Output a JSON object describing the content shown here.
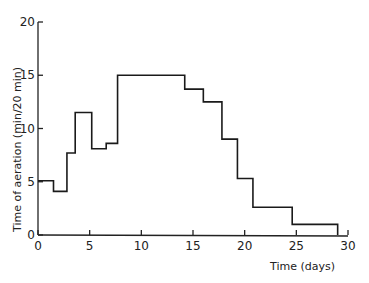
{
  "chart_data": {
    "type": "line",
    "style": "step",
    "title": "",
    "xlabel": "Time (days)",
    "ylabel": "Time of aeration (min/20 min)",
    "xlim": [
      0,
      30
    ],
    "ylim": [
      0,
      20
    ],
    "x_ticks": [
      0,
      5,
      10,
      15,
      20,
      25,
      30
    ],
    "y_ticks": [
      0,
      5,
      10,
      15,
      20
    ],
    "x_tick_labels": [
      "0",
      "5",
      "10",
      "15",
      "20",
      "25",
      "30"
    ],
    "y_tick_labels": [
      "0",
      "5",
      "10",
      "15",
      "20"
    ],
    "grid": false,
    "legend": null,
    "series": [
      {
        "name": "Time of aeration",
        "steps": [
          {
            "x_start": 0.0,
            "x_end": 1.5,
            "y": 5.1
          },
          {
            "x_start": 1.5,
            "x_end": 2.8,
            "y": 4.1
          },
          {
            "x_start": 2.8,
            "x_end": 3.6,
            "y": 7.7
          },
          {
            "x_start": 3.6,
            "x_end": 5.2,
            "y": 11.5
          },
          {
            "x_start": 5.2,
            "x_end": 6.6,
            "y": 8.1
          },
          {
            "x_start": 6.6,
            "x_end": 7.7,
            "y": 8.6
          },
          {
            "x_start": 7.7,
            "x_end": 14.2,
            "y": 15.0
          },
          {
            "x_start": 14.2,
            "x_end": 16.0,
            "y": 13.7
          },
          {
            "x_start": 16.0,
            "x_end": 17.8,
            "y": 12.5
          },
          {
            "x_start": 17.8,
            "x_end": 19.3,
            "y": 9.0
          },
          {
            "x_start": 19.3,
            "x_end": 20.8,
            "y": 5.3
          },
          {
            "x_start": 20.8,
            "x_end": 24.6,
            "y": 2.6
          },
          {
            "x_start": 24.6,
            "x_end": 29.0,
            "y": 1.0
          }
        ],
        "end_drop_to": 0
      }
    ]
  }
}
